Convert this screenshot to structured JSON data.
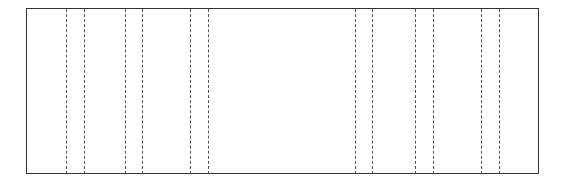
{
  "diagram": {
    "frame": {
      "left": 26,
      "top": 8,
      "width": 513,
      "height": 166,
      "border_color": "#333333"
    },
    "dashed_lines": {
      "color": "#555555",
      "pairs": [
        {
          "name": "pair-1",
          "x": [
            66,
            84
          ]
        },
        {
          "name": "pair-2",
          "x": [
            125,
            142
          ]
        },
        {
          "name": "pair-3",
          "x": [
            190,
            208
          ]
        },
        {
          "name": "pair-4",
          "x": [
            355,
            372
          ]
        },
        {
          "name": "pair-5",
          "x": [
            415,
            433
          ]
        },
        {
          "name": "pair-6",
          "x": [
            481,
            499
          ]
        }
      ]
    }
  }
}
